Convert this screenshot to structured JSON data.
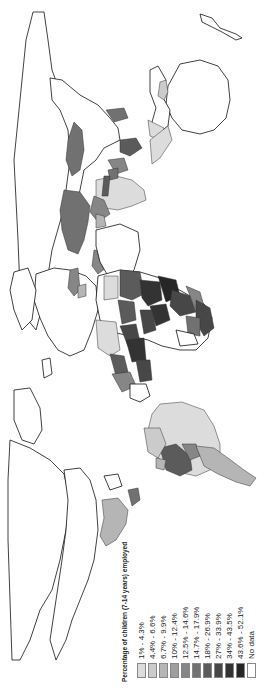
{
  "map": {
    "type": "choropleth",
    "orientation": "rotated 90 degrees counterclockwise",
    "subject": "Percentage of children (7-14 years) employed"
  },
  "legend": {
    "title": "Percentage of children (7-14 years) employed",
    "items": [
      {
        "label": "1% - 4.3%",
        "color": "#dcdcdc"
      },
      {
        "label": "4.4% - 6.6%",
        "color": "#cbcbcb"
      },
      {
        "label": "6.7% - 9.9%",
        "color": "#b5b5b5"
      },
      {
        "label": "10% - 12.4%",
        "color": "#9e9e9e"
      },
      {
        "label": "12.5% - 14.6%",
        "color": "#868686"
      },
      {
        "label": "14.7% - 17.9%",
        "color": "#717171"
      },
      {
        "label": "18% - 26.9%",
        "color": "#5b5b5b"
      },
      {
        "label": "27% - 33.9%",
        "color": "#474747"
      },
      {
        "label": "34% - 43.5%",
        "color": "#333333"
      },
      {
        "label": "43.6% - 52.1%",
        "color": "#262626"
      },
      {
        "label": "No data",
        "color": "#ffffff"
      }
    ]
  }
}
